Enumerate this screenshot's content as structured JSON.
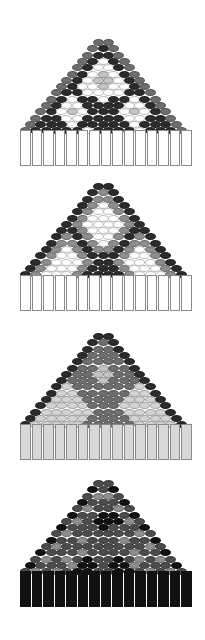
{
  "palette": {
    "G": "#6e6e6e",
    "D": "#2b2b2b",
    "W": "#ffffff",
    "L": "#c4c4c4",
    "M": "#8e8e8e",
    "K": "#111111",
    "S": "#4c4c4c",
    "P": "#d4d4d4"
  },
  "patterns": [
    {
      "name": "pattern-1",
      "top": 39,
      "bar_top": 130,
      "bar_fill": "#ffffff",
      "bar_border": "#8a8a8a",
      "rows": [
        "GG",
        "GDG",
        "GDDG",
        "GDWDG",
        "GDWWDG",
        "GDWLWDG",
        "GDWLLWDG",
        "GDWWLWWDG",
        "GDDWWWWDDG",
        "GDWDDWDDWDG",
        "GDWWDDDDWWDG",
        "GDWLWDDDWLWDG",
        "GDDWWDDDDWWDDG",
        "GDDDWDDDDDWDDDG",
        "GDDDDDWDDDDWDDDG"
      ]
    },
    {
      "name": "pattern-2",
      "top": 183,
      "bar_top": 275,
      "bar_fill": "#ffffff",
      "bar_border": "#8a8a8a",
      "rows": [
        "DD",
        "DMD",
        "DMMD",
        "DMWMD",
        "DMWWMD",
        "DMWWWMD",
        "DMWWWWMD",
        "DDMWWWMDD",
        "DMDMWWMDMD",
        "DMMDMWMDMMD",
        "DMWMDMMDMWMD",
        "DMWWMDDDMWWMD",
        "DMWWWMDDMWWWMD",
        "DMWWWMDDDMWWWMD",
        "DMWWWMDDDDMWWWMD"
      ]
    },
    {
      "name": "pattern-3",
      "top": 333,
      "bar_top": 424,
      "bar_fill": "#d8d8d8",
      "bar_border": "#8a8a8a",
      "rows": [
        "DD",
        "DGD",
        "DGGD",
        "DGGGD",
        "DGGGGD",
        "DGGLGGD",
        "DGGLLGGD",
        "DGGGLGGGD",
        "DPGGGGGGPD",
        "DPPGGGGGPPD",
        "DPPPGGGGPPPD",
        "DPPPPGGGPPPPD",
        "DPPPPPGGGPPPPD",
        "DPPPPPGGGGPPPPD",
        "DPPPPPGGGGGPPPPD"
      ]
    },
    {
      "name": "pattern-4",
      "top": 480,
      "bar_top": 571,
      "bar_fill": "#111111",
      "bar_border": "#111111",
      "rows": [
        "SS",
        "KSK",
        "SMMS",
        "KSSSK",
        "SMSSMS",
        "KSSKKSK",
        "SMSKKKMS",
        "KSSSKSSSK",
        "SMSSSSSSMS",
        "KSSMSSSMSSK",
        "SMSSSSSSSSMS",
        "KSSSMSSSSMSSK",
        "SMSMSKSSKSMSMS",
        "KSSSMKKSKKMSSSK",
        "SMSMSKKSSKKSMSMS"
      ]
    }
  ],
  "fringe_count": 15
}
